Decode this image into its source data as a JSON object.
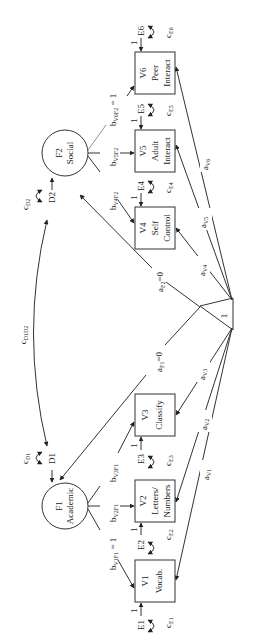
{
  "diagram": {
    "type": "structural-equation-path-diagram",
    "orientation": "rotated-90-clockwise",
    "constant": {
      "label": "1"
    },
    "factors": [
      {
        "id": "F1",
        "label": "F1",
        "name": "Academic",
        "disturbance": "D1",
        "variance": "c",
        "variance_sub": "D1"
      },
      {
        "id": "F2",
        "label": "F2",
        "name": "Social",
        "disturbance": "D2",
        "variance": "c",
        "variance_sub": "D2"
      }
    ],
    "factor_covariance": {
      "main": "c",
      "sub": "D1D2"
    },
    "indicators": [
      {
        "id": "V1",
        "label": "V1",
        "line1": "Vocab.",
        "line2": "",
        "error": "E1",
        "err_var": "c",
        "err_var_sub": "E1",
        "loading": "b",
        "loading_sub": "V1F1",
        "loading_suffix": " = 1",
        "mean": "a",
        "mean_sub": "V1",
        "error_path": "1"
      },
      {
        "id": "V2",
        "label": "V2",
        "line1": "Letters/",
        "line2": "Numbers",
        "error": "E2",
        "err_var": "c",
        "err_var_sub": "E2",
        "loading": "b",
        "loading_sub": "V2F1",
        "loading_suffix": "",
        "mean": "a",
        "mean_sub": "V2",
        "error_path": "1"
      },
      {
        "id": "V3",
        "label": "V3",
        "line1": "Classify",
        "line2": "",
        "error": "E3",
        "err_var": "c",
        "err_var_sub": "E3",
        "loading": "b",
        "loading_sub": "V3F1",
        "loading_suffix": "",
        "mean": "a",
        "mean_sub": "V3",
        "error_path": "1"
      },
      {
        "id": "V4",
        "label": "V4",
        "line1": "Self",
        "line2": "Control",
        "error": "E4",
        "err_var": "c",
        "err_var_sub": "E4",
        "loading": "b",
        "loading_sub": "V4F2",
        "loading_suffix": "",
        "mean": "a",
        "mean_sub": "V4",
        "error_path": "1"
      },
      {
        "id": "V5",
        "label": "V5",
        "line1": "Adult",
        "line2": "Interact",
        "error": "E5",
        "err_var": "c",
        "err_var_sub": "E5",
        "loading": "b",
        "loading_sub": "V5F2",
        "loading_suffix": "",
        "mean": "a",
        "mean_sub": "V5",
        "error_path": "1"
      },
      {
        "id": "V6",
        "label": "V6",
        "line1": "Peer",
        "line2": "Interact",
        "error": "E6",
        "err_var": "c",
        "err_var_sub": "E6",
        "loading": "b",
        "loading_sub": "V6F2",
        "loading_suffix": " = 1",
        "mean": "a",
        "mean_sub": "V6",
        "error_path": "1"
      }
    ],
    "factor_means": [
      {
        "main": "a",
        "sub": "F1",
        "suffix": "=0"
      },
      {
        "main": "a",
        "sub": "F2",
        "suffix": "=0"
      }
    ]
  }
}
